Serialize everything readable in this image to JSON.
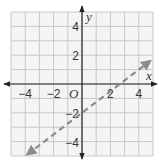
{
  "chart_data": {
    "type": "line",
    "title": "",
    "xlabel": "x",
    "ylabel": "y",
    "origin_label": "O",
    "xlim": [
      -5,
      5
    ],
    "ylim": [
      -5,
      5
    ],
    "grid": true,
    "x_ticks": [
      -4,
      -2,
      2,
      4
    ],
    "y_ticks": [
      4,
      2,
      -2,
      -4
    ],
    "x_tick_labels": [
      "−4",
      "−2",
      "2",
      "4"
    ],
    "y_tick_labels": [
      "4",
      "2",
      "−2",
      "−4"
    ],
    "series": [
      {
        "name": "y = 0.75x - 2",
        "style": "dashed",
        "slope": 0.75,
        "intercept": -2,
        "x": [
          -3.85,
          4.8
        ],
        "y": [
          -4.89,
          1.6
        ],
        "color": "#8c8c8c",
        "arrows": "both"
      }
    ],
    "colors": {
      "grid": "#c8c8c8",
      "axis": "#222222",
      "background": "#f4f4f4"
    }
  }
}
